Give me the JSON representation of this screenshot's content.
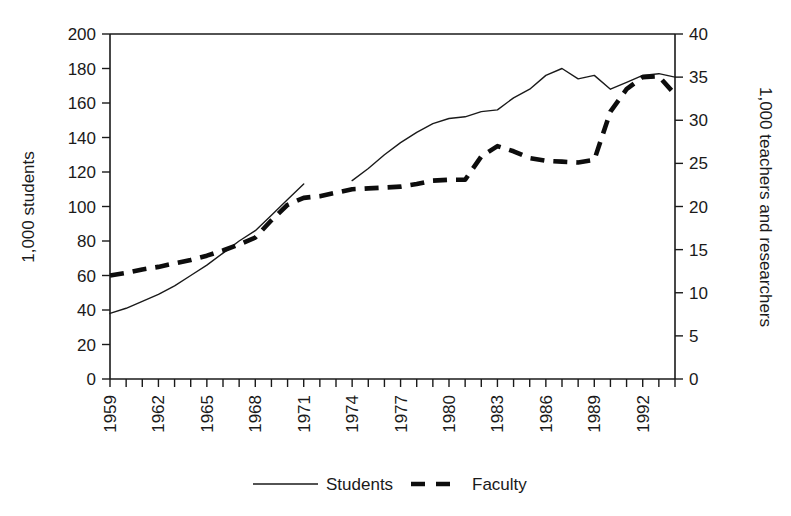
{
  "chart_data": {
    "type": "line",
    "title": "",
    "xlabel": "",
    "ylabel": "1,000 students",
    "y2label": "1,000 teachers and researchers",
    "grid": false,
    "legend_position": "bottom-center",
    "xlim": [
      1959,
      1994
    ],
    "ylim": [
      0,
      200
    ],
    "y2lim": [
      0,
      40
    ],
    "x_tick_step": 1,
    "x_label_step": 3,
    "x_tick_labels": [
      "1959",
      "1962",
      "1965",
      "1968",
      "1971",
      "1974",
      "1977",
      "1980",
      "1983",
      "1986",
      "1989",
      "1992"
    ],
    "y_tick_labels": [
      "0",
      "20",
      "40",
      "60",
      "80",
      "100",
      "120",
      "140",
      "160",
      "180",
      "200"
    ],
    "y2_tick_labels": [
      "0",
      "5",
      "10",
      "15",
      "20",
      "25",
      "30",
      "35",
      "40"
    ],
    "x": [
      1959,
      1960,
      1961,
      1962,
      1963,
      1964,
      1965,
      1966,
      1967,
      1968,
      1969,
      1970,
      1971,
      1972,
      1973,
      1974,
      1975,
      1976,
      1977,
      1978,
      1979,
      1980,
      1981,
      1982,
      1983,
      1984,
      1985,
      1986,
      1987,
      1988,
      1989,
      1990,
      1991,
      1992,
      1993,
      1994
    ],
    "series": [
      {
        "name": "Students",
        "axis": "left",
        "style": "solid-thin",
        "color": "#1a1a1a",
        "values": [
          38,
          41,
          45,
          49,
          54,
          60,
          66,
          73,
          80,
          86,
          95,
          104,
          113,
          null,
          null,
          115,
          122,
          130,
          137,
          143,
          148,
          151,
          152,
          155,
          156,
          163,
          168,
          176,
          180,
          174,
          176,
          168,
          172,
          176,
          177,
          175
        ]
      },
      {
        "name": "Faculty",
        "axis": "right",
        "style": "dashed-thick",
        "color": "#0d0d0d",
        "values": [
          12.0,
          12.3,
          12.7,
          13.0,
          13.4,
          13.8,
          14.3,
          14.9,
          15.6,
          16.4,
          18.4,
          20.2,
          21.0,
          21.2,
          21.6,
          22.0,
          22.1,
          22.2,
          22.3,
          22.6,
          23.0,
          23.1,
          23.1,
          25.8,
          27.0,
          26.4,
          25.6,
          25.3,
          25.2,
          25.1,
          25.4,
          31.0,
          33.6,
          35.0,
          35.1,
          33.0
        ]
      }
    ],
    "legend": [
      {
        "label": "Students",
        "marker": "solid-thin-line"
      },
      {
        "label": "Faculty",
        "marker": "dashed-thick-line"
      }
    ]
  }
}
